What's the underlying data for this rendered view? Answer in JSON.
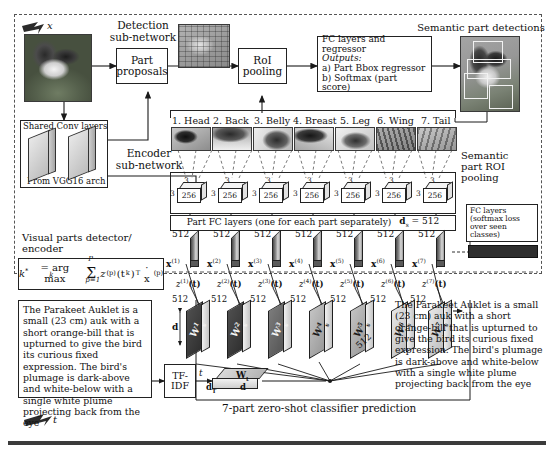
{
  "figure": {
    "input_label": "x",
    "text_arrow_label": "t"
  },
  "detection": {
    "subnetwork_label": "Detection\nsub-network",
    "part_proposals": "Part\nproposals",
    "roi_pooling": "RoI\npooling",
    "fc_regressor_title": "FC layers and regressor",
    "fc_regressor_outputs_label": "Outputs:",
    "fc_regressor_a": "a) Part Bbox regressor",
    "fc_regressor_b": "b) Softmax (part  score)",
    "semantic_part_detections": "Semantic part detections"
  },
  "encoder": {
    "shared_conv_layers": "Shared Conv layers",
    "from_vgg": "From VGG16 arch",
    "encoder_subnetwork": "Encoder\nsub-network",
    "semantic_roi_pooling": "Semantic\npart ROI\npooling",
    "fc_softmax_seen": "FC layers\n(softmax loss\nover seen\nclasses)",
    "visual_parts_detector": "Visual parts detector/\nencoder",
    "part_fc_layers": "Part FC layers (one for each part separately)",
    "ds_label": "d",
    "ds_sub": "s",
    "ds_value": "= 512"
  },
  "parts": [
    {
      "index": "1.",
      "name": "Head",
      "cube_depth": "3",
      "cube_depth2": "3",
      "cube_channels": "256",
      "x_label": "x",
      "x_sup": "(1)",
      "x_dim": "512",
      "z_label": "z",
      "z_sup": "(1)",
      "z_arg": "(t)",
      "z_dim": "512",
      "w_label": "W",
      "w_sup": "1",
      "w_sub": "s"
    },
    {
      "index": "2.",
      "name": "Back",
      "cube_depth": "3",
      "cube_depth2": "3",
      "cube_channels": "256",
      "x_label": "x",
      "x_sup": "(2)",
      "x_dim": "512",
      "z_label": "z",
      "z_sup": "(2)",
      "z_arg": "(t)",
      "z_dim": "512",
      "w_label": "W",
      "w_sup": "2",
      "w_sub": "s"
    },
    {
      "index": "3.",
      "name": "Belly",
      "cube_depth": "3",
      "cube_depth2": "3",
      "cube_channels": "256",
      "x_label": "x",
      "x_sup": "(3)",
      "x_dim": "512",
      "z_label": "z",
      "z_sup": "(3)",
      "z_arg": "(t)",
      "z_dim": "512",
      "w_label": "W",
      "w_sup": "3",
      "w_sub": "s"
    },
    {
      "index": "4.",
      "name": "Breast",
      "cube_depth": "3",
      "cube_depth2": "3",
      "cube_channels": "256",
      "x_label": "x",
      "x_sup": "(4)",
      "x_dim": "512",
      "z_label": "z",
      "z_sup": "(4)",
      "z_arg": "(t)",
      "z_dim": "512",
      "w_label": "W",
      "w_sup": "4",
      "w_sub": "s"
    },
    {
      "index": "5.",
      "name": "Leg",
      "cube_depth": "3",
      "cube_depth2": "3",
      "cube_channels": "256",
      "x_label": "x",
      "x_sup": "(5)",
      "x_dim": "512",
      "z_label": "z",
      "z_sup": "(5)",
      "z_arg": "(t)",
      "z_dim": "512",
      "w_label": "W",
      "w_sup": "5",
      "w_sub": "s"
    },
    {
      "index": "6.",
      "name": "Wing",
      "cube_depth": "3",
      "cube_depth2": "3",
      "cube_channels": "256",
      "x_label": "x",
      "x_sup": "(6)",
      "x_dim": "512",
      "z_label": "z",
      "z_sup": "(6)",
      "z_arg": "(t)",
      "z_dim": "512",
      "w_label": "W",
      "w_sup": "6",
      "w_sub": "s"
    },
    {
      "index": "7.",
      "name": "Tail",
      "cube_depth": "3",
      "cube_depth2": "3",
      "cube_channels": "256",
      "x_label": "x",
      "x_sup": "(7)",
      "x_dim": "512",
      "z_label": "z",
      "z_sup": "(7)",
      "z_arg": "(t)",
      "z_dim": "512",
      "w_label": "W",
      "w_sup": "7",
      "w_sub": "s"
    }
  ],
  "equation": {
    "lhs": "k",
    "lhs_sup": "*",
    "eq": "= arg max",
    "argmax_sub": "k",
    "sigma": "Σ",
    "sigma_top": "P",
    "sigma_bottom": "p=1",
    "term_z": "z",
    "term_z_sup": "(p)",
    "term_t": "(t",
    "term_t_sub": "k",
    "term_t_close": ")",
    "term_transpose": "T",
    "term_dot": "· x",
    "term_x_sup": "(p)"
  },
  "text_description": {
    "left": "The Parakeet Auklet is a small (23 cm) auk with a short orange-bill that is upturned to give the bird its curious fixed expression. The bird's plumage is dark-above and white-below with a single white plume projecting back from the eye",
    "right": "The Parakeet Auklet is a small (23 cm) auk with a short orange-bill that is upturned to give the bird its curious fixed expression. The bird's plumage is dark-above and white-below with a single white plume projecting back from the eye"
  },
  "text_branch": {
    "tfidf": "TF-\nIDF",
    "t_label": "t",
    "wt_label": "W",
    "wt_sub": "t",
    "dT_label": "d",
    "dT_sub": "T",
    "d_label": "d",
    "classifier_caption": "7-part zero-shot classifier prediction",
    "dim_512": "512",
    "dim_d": "d"
  }
}
